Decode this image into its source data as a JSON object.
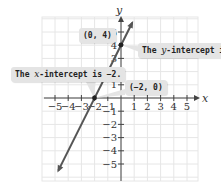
{
  "chart_data": {
    "type": "line",
    "title": "",
    "xlabel": "x",
    "ylabel": "y",
    "xlim": [
      -5.5,
      5.5
    ],
    "ylim": [
      -5.5,
      5.5
    ],
    "grid": true,
    "x_ticks": [
      -5,
      -4,
      -3,
      -2,
      -1,
      1,
      2,
      3,
      4,
      5
    ],
    "y_ticks": [
      -5,
      -4,
      -3,
      -2,
      -1,
      1,
      2,
      3,
      4,
      5
    ],
    "x_tick_labels": [
      "−5",
      "−4",
      "−3",
      "−2",
      "−1",
      "1",
      "2",
      "3",
      "4",
      "5"
    ],
    "y_tick_labels": [
      "−5",
      "−4",
      "−3",
      "−2",
      "−1",
      "1",
      "2",
      "3",
      "4",
      "5"
    ],
    "series": [
      {
        "name": "y = 2x + 4",
        "slope": 2,
        "intercept": 4,
        "x": [
          -4.75,
          0.85
        ],
        "y": [
          -5.5,
          5.7
        ],
        "color": "#555555"
      }
    ],
    "points": [
      {
        "label": "(0, 4)",
        "x": 0,
        "y": 4
      },
      {
        "label": "(−2, 0)",
        "x": -2,
        "y": 0
      }
    ],
    "annotations": [
      {
        "text": "The y-intercept is 4.",
        "points_to": [
          0,
          4
        ]
      },
      {
        "text": "The x-intercept is −2.",
        "points_to": [
          -2,
          0
        ]
      }
    ]
  },
  "labels": {
    "axis_x": "x",
    "axis_y": "y",
    "point_y_intercept": "(0, 4)",
    "point_x_intercept": "(−2, 0)",
    "y_intercept_prefix": "The ",
    "y_intercept_var": "y",
    "y_intercept_suffix": "-intercept is 4.",
    "x_intercept_prefix": "The ",
    "x_intercept_var": "x",
    "x_intercept_suffix": "-intercept is −2."
  },
  "colors": {
    "grid": "#e6e6e6",
    "axis": "#444444",
    "line": "#555555",
    "callout_bg": "#e4e4e4"
  }
}
